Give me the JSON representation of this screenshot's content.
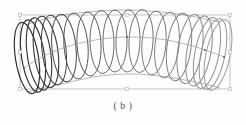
{
  "figure": {
    "caption": "( b )",
    "type": "3d-helical-coil-viewport",
    "background_color": "#fefefe",
    "canvas": {
      "width": 246,
      "height": 125
    }
  },
  "selection_box": {
    "label": "selection-bounding-box",
    "color": "#b8b8b8",
    "x": 20,
    "y": 15,
    "width": 210,
    "height": 74,
    "handles": [
      {
        "name": "handle-top-left",
        "x": 20,
        "y": 15,
        "kind": "corner"
      },
      {
        "name": "handle-top-center",
        "x": 127,
        "y": 15,
        "kind": "edge"
      },
      {
        "name": "handle-top-right",
        "x": 230,
        "y": 15,
        "kind": "corner"
      },
      {
        "name": "handle-middle-left",
        "x": 20,
        "y": 52,
        "kind": "edge"
      },
      {
        "name": "handle-middle-right",
        "x": 230,
        "y": 52,
        "kind": "edge"
      },
      {
        "name": "handle-bottom-left",
        "x": 20,
        "y": 89,
        "kind": "corner"
      },
      {
        "name": "handle-bottom-center",
        "x": 127,
        "y": 89,
        "kind": "edge"
      },
      {
        "name": "handle-bottom-right",
        "x": 230,
        "y": 89,
        "kind": "corner"
      }
    ]
  },
  "chart_data": {
    "type": "scatter",
    "title": "( b )",
    "subtitle": "",
    "xlabel": "",
    "ylabel": "",
    "grid": false,
    "legend": null,
    "xlim": [
      20,
      232
    ],
    "ylim": [
      12,
      95
    ],
    "spine_path": {
      "name": "coil-axis-curve",
      "color": "#9a9a9a",
      "points": [
        [
          24,
          68
        ],
        [
          40,
          58
        ],
        [
          60,
          49
        ],
        [
          85,
          42
        ],
        [
          110,
          38
        ],
        [
          135,
          37
        ],
        [
          160,
          39
        ],
        [
          185,
          44
        ],
        [
          205,
          50
        ],
        [
          224,
          57
        ]
      ]
    },
    "spine_nodes": [
      {
        "x": 24,
        "y": 68
      },
      {
        "x": 127,
        "y": 37
      },
      {
        "x": 205,
        "y": 50
      },
      {
        "x": 224,
        "y": 57
      }
    ],
    "rings": [
      {
        "i": 1,
        "cx": 27,
        "cy": 58,
        "rx": 11.5,
        "ry": 36.0,
        "rot": -9.0,
        "stroke": "#2b2b2b",
        "width": 1.15
      },
      {
        "i": 2,
        "cx": 33,
        "cy": 56,
        "rx": 11.5,
        "ry": 36.5,
        "rot": -8.5,
        "stroke": "#303030",
        "width": 1.15
      },
      {
        "i": 3,
        "cx": 39,
        "cy": 54,
        "rx": 11.8,
        "ry": 36.5,
        "rot": -8.0,
        "stroke": "#343434",
        "width": 1.1
      },
      {
        "i": 4,
        "cx": 46,
        "cy": 52,
        "rx": 12.0,
        "ry": 36.0,
        "rot": -7.5,
        "stroke": "#3a3a3a",
        "width": 1.1
      },
      {
        "i": 5,
        "cx": 54,
        "cy": 50,
        "rx": 12.0,
        "ry": 35.0,
        "rot": -6.5,
        "stroke": "#444444",
        "width": 1.0
      },
      {
        "i": 6,
        "cx": 64,
        "cy": 48,
        "rx": 12.0,
        "ry": 34.0,
        "rot": -5.5,
        "stroke": "#4a4a4a",
        "width": 1.0
      },
      {
        "i": 7,
        "cx": 76,
        "cy": 46,
        "rx": 12.0,
        "ry": 33.0,
        "rot": -4.5,
        "stroke": "#505050",
        "width": 0.95
      },
      {
        "i": 8,
        "cx": 89,
        "cy": 44,
        "rx": 12.0,
        "ry": 32.0,
        "rot": -3.0,
        "stroke": "#555555",
        "width": 0.95
      },
      {
        "i": 9,
        "cx": 102,
        "cy": 42,
        "rx": 12.0,
        "ry": 31.5,
        "rot": -1.5,
        "stroke": "#5a5a5a",
        "width": 0.9
      },
      {
        "i": 10,
        "cx": 115,
        "cy": 41,
        "rx": 12.0,
        "ry": 31.0,
        "rot": 0.0,
        "stroke": "#5e5e5e",
        "width": 0.9
      },
      {
        "i": 11,
        "cx": 128,
        "cy": 41,
        "rx": 12.0,
        "ry": 31.0,
        "rot": 1.5,
        "stroke": "#636363",
        "width": 0.9
      },
      {
        "i": 12,
        "cx": 141,
        "cy": 41,
        "rx": 12.0,
        "ry": 31.5,
        "rot": 3.0,
        "stroke": "#686868",
        "width": 0.9
      },
      {
        "i": 13,
        "cx": 154,
        "cy": 43,
        "rx": 12.0,
        "ry": 32.0,
        "rot": 4.5,
        "stroke": "#6e6e6e",
        "width": 0.9
      },
      {
        "i": 14,
        "cx": 167,
        "cy": 45,
        "rx": 12.0,
        "ry": 33.0,
        "rot": 6.0,
        "stroke": "#757575",
        "width": 0.9
      },
      {
        "i": 15,
        "cx": 179,
        "cy": 47,
        "rx": 12.0,
        "ry": 34.0,
        "rot": 7.5,
        "stroke": "#7c7c7c",
        "width": 0.95
      },
      {
        "i": 16,
        "cx": 190,
        "cy": 49,
        "rx": 12.0,
        "ry": 35.0,
        "rot": 9.0,
        "stroke": "#848484",
        "width": 0.95
      },
      {
        "i": 17,
        "cx": 199,
        "cy": 51,
        "rx": 12.0,
        "ry": 35.5,
        "rot": 10.0,
        "stroke": "#8b8b8b",
        "width": 1.0
      },
      {
        "i": 18,
        "cx": 207,
        "cy": 53,
        "rx": 12.0,
        "ry": 36.0,
        "rot": 11.0,
        "stroke": "#919191",
        "width": 1.0
      },
      {
        "i": 19,
        "cx": 213,
        "cy": 54,
        "rx": 12.0,
        "ry": 36.0,
        "rot": 11.5,
        "stroke": "#969696",
        "width": 1.0
      },
      {
        "i": 20,
        "cx": 218,
        "cy": 55,
        "rx": 12.0,
        "ry": 36.0,
        "rot": 12.0,
        "stroke": "#9b9b9b",
        "width": 1.0
      }
    ],
    "envelope_top": {
      "name": "coil-envelope-top",
      "color": "#888888",
      "points": [
        [
          26,
          25
        ],
        [
          45,
          19
        ],
        [
          70,
          14
        ],
        [
          100,
          11
        ],
        [
          130,
          10
        ],
        [
          160,
          12
        ],
        [
          185,
          15
        ],
        [
          205,
          19
        ],
        [
          220,
          22
        ]
      ]
    },
    "envelope_bottom": {
      "name": "coil-envelope-bottom",
      "color": "#888888",
      "points": [
        [
          26,
          92
        ],
        [
          45,
          88
        ],
        [
          70,
          82
        ],
        [
          100,
          76
        ],
        [
          130,
          74
        ],
        [
          160,
          76
        ],
        [
          185,
          80
        ],
        [
          205,
          84
        ],
        [
          220,
          88
        ]
      ]
    }
  }
}
